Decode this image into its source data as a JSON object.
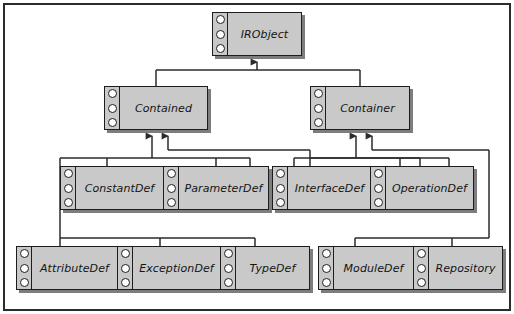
{
  "diagram": {
    "type": "uml-class-inheritance",
    "colors": {
      "box_fill": "#c9c9c9",
      "box_border": "#1d1d1d",
      "shadow": "#7d7d7d",
      "line": "#2b2b2b",
      "page_background": "#ffffff",
      "frame_border": "#2b2b2b",
      "port_fill": "#ffffff"
    },
    "ports_per_box": 3,
    "nodes": [
      {
        "id": "irobject",
        "label": "IRObject",
        "row": 1,
        "x": 212,
        "y": 12,
        "w": 90,
        "h": 44
      },
      {
        "id": "contained",
        "label": "Contained",
        "row": 2,
        "x": 104,
        "y": 86,
        "w": 104,
        "h": 44
      },
      {
        "id": "container",
        "label": "Container",
        "row": 2,
        "x": 310,
        "y": 86,
        "w": 100,
        "h": 44
      },
      {
        "id": "constantdef",
        "label": "ConstantDef",
        "row": 3,
        "x": 60,
        "y": 166,
        "w": 104,
        "h": 44
      },
      {
        "id": "parameterdef",
        "label": "ParameterDef",
        "row": 3,
        "x": 163,
        "y": 166,
        "w": 106,
        "h": 44
      },
      {
        "id": "interfacedef",
        "label": "InterfaceDef",
        "row": 3,
        "x": 272,
        "y": 166,
        "w": 100,
        "h": 44
      },
      {
        "id": "operationdef",
        "label": "OperationDef",
        "row": 3,
        "x": 370,
        "y": 166,
        "w": 104,
        "h": 44
      },
      {
        "id": "attributedef",
        "label": "AttributeDef",
        "row": 4,
        "x": 16,
        "y": 246,
        "w": 102,
        "h": 44
      },
      {
        "id": "exceptiondef",
        "label": "ExceptionDef",
        "row": 4,
        "x": 117,
        "y": 246,
        "w": 104,
        "h": 44
      },
      {
        "id": "typedef",
        "label": "TypeDef",
        "row": 4,
        "x": 220,
        "y": 246,
        "w": 90,
        "h": 44
      },
      {
        "id": "moduledef",
        "label": "ModuleDef",
        "row": 4,
        "x": 318,
        "y": 246,
        "w": 96,
        "h": 44
      },
      {
        "id": "repository",
        "label": "Repository",
        "row": 4,
        "x": 413,
        "y": 246,
        "w": 90,
        "h": 44
      }
    ],
    "edges": [
      {
        "from": "contained",
        "to": "irobject",
        "kind": "generalization"
      },
      {
        "from": "container",
        "to": "irobject",
        "kind": "generalization"
      },
      {
        "from": "constantdef",
        "to": "contained",
        "kind": "generalization"
      },
      {
        "from": "parameterdef",
        "to": "contained",
        "kind": "generalization"
      },
      {
        "from": "interfacedef",
        "to": "contained",
        "kind": "generalization"
      },
      {
        "from": "operationdef",
        "to": "contained",
        "kind": "generalization"
      },
      {
        "from": "attributedef",
        "to": "contained",
        "kind": "generalization"
      },
      {
        "from": "exceptiondef",
        "to": "contained",
        "kind": "generalization"
      },
      {
        "from": "typedef",
        "to": "contained",
        "kind": "generalization"
      },
      {
        "from": "moduledef",
        "to": "contained",
        "kind": "generalization"
      },
      {
        "from": "interfacedef",
        "to": "container",
        "kind": "generalization"
      },
      {
        "from": "operationdef",
        "to": "container",
        "kind": "generalization"
      },
      {
        "from": "moduledef",
        "to": "container",
        "kind": "generalization"
      },
      {
        "from": "repository",
        "to": "container",
        "kind": "generalization"
      }
    ]
  }
}
